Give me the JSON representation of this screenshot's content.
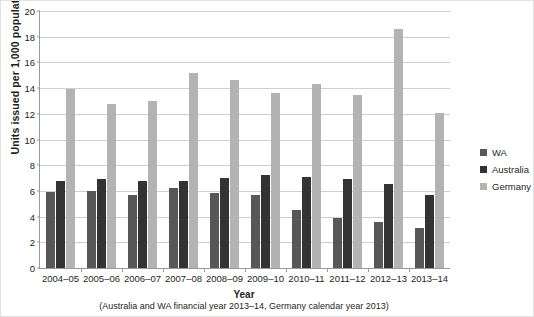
{
  "chart_data": {
    "type": "bar",
    "title": "",
    "xlabel": "Year",
    "xlabel_note": "(Australia and WA financial year 2013–14, Germany calendar year 2013)",
    "ylabel": "Units issued per 1,000 population",
    "ylim": [
      0,
      20
    ],
    "ytick_step": 2,
    "ytick_labels": [
      "0",
      "2",
      "4",
      "6",
      "8",
      "10",
      "12",
      "14",
      "16",
      "18",
      "20"
    ],
    "grid": true,
    "legend_position": "right",
    "categories": [
      "2004–05",
      "2005–06",
      "2006–07",
      "2007–08",
      "2008–09",
      "2009–10",
      "2010–11",
      "2011–12",
      "2012–13",
      "2013–14"
    ],
    "series": [
      {
        "name": "WA",
        "color": "#575757",
        "values": [
          5.9,
          6.0,
          5.7,
          6.2,
          5.8,
          5.7,
          4.5,
          3.9,
          3.6,
          3.1
        ]
      },
      {
        "name": "Australia",
        "color": "#333333",
        "values": [
          6.8,
          6.9,
          6.8,
          6.8,
          7.0,
          7.2,
          7.1,
          6.9,
          6.5,
          5.7
        ]
      },
      {
        "name": "Germany",
        "color": "#b3b3b3",
        "values": [
          13.9,
          12.8,
          13.0,
          15.2,
          14.6,
          13.6,
          14.3,
          13.5,
          18.6,
          12.1
        ]
      }
    ]
  },
  "legend": {
    "items": [
      {
        "label": "WA",
        "color": "#575757"
      },
      {
        "label": "Australia",
        "color": "#333333"
      },
      {
        "label": "Germany",
        "color": "#b3b3b3"
      }
    ]
  }
}
